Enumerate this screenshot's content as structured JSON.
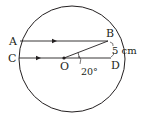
{
  "diagram": {
    "type": "circle-geometry",
    "colors": {
      "stroke": "#231f20",
      "background": "#ffffff"
    },
    "circle": {
      "cx": 72,
      "cy": 59,
      "r": 53
    },
    "center_label": "O",
    "points": {
      "A": "A",
      "B": "B",
      "C": "C",
      "D": "D",
      "O": "O"
    },
    "measurements": {
      "arc_BD": "5 cm",
      "angle_BOD": "20°"
    },
    "chords": [
      {
        "name": "AB",
        "parallel_arrow": true
      },
      {
        "name": "CD",
        "parallel_arrow": true,
        "through_center": true
      }
    ],
    "segments": [
      {
        "name": "OB"
      }
    ]
  }
}
